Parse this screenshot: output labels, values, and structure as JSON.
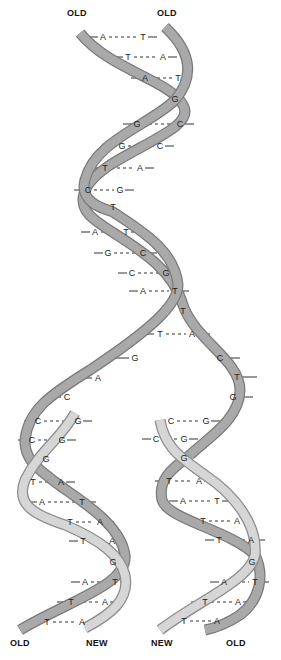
{
  "labels": {
    "top_left": "OLD",
    "top_right": "OLD",
    "bottom_1": "OLD",
    "bottom_2": "NEW",
    "bottom_3": "NEW",
    "bottom_4": "OLD"
  },
  "colors": {
    "old_strand": "#a9a9a9",
    "old_strand_edge": "#7a7a7a",
    "new_strand": "#d6d6d6",
    "new_strand_edge": "#8c8c8c",
    "text": "#222222"
  },
  "parent_helix": {
    "base_pairs": [
      {
        "left": "A",
        "right": "T",
        "x1": 103,
        "x2": 143,
        "y": 37
      },
      {
        "left": "T",
        "right": "A",
        "x1": 128,
        "x2": 163,
        "y": 57
      },
      {
        "left": "A",
        "right": "T",
        "x1": 145,
        "x2": 178,
        "y": 78
      },
      {
        "left": "G",
        "right": "",
        "x1": 175,
        "x2": 175,
        "y": 99
      },
      {
        "left": "G",
        "right": "C",
        "x1": 137,
        "x2": 180,
        "y": 124
      },
      {
        "left": "G",
        "right": "C",
        "x1": 122,
        "x2": 160,
        "y": 146
      },
      {
        "left": "T",
        "right": "A",
        "x1": 105,
        "x2": 140,
        "y": 168
      },
      {
        "left": "C",
        "right": "G",
        "x1": 88,
        "x2": 120,
        "y": 190
      },
      {
        "left": "T",
        "right": "",
        "x1": 113,
        "x2": 113,
        "y": 207
      },
      {
        "left": "A",
        "right": "T",
        "x1": 95,
        "x2": 126,
        "y": 232
      },
      {
        "left": "G",
        "right": "C",
        "x1": 108,
        "x2": 143,
        "y": 253
      },
      {
        "left": "C",
        "right": "G",
        "x1": 132,
        "x2": 166,
        "y": 273
      },
      {
        "left": "A",
        "right": "T",
        "x1": 143,
        "x2": 175,
        "y": 291
      },
      {
        "left": "T",
        "right": "",
        "x1": 183,
        "x2": 183,
        "y": 311
      }
    ]
  },
  "fork": {
    "left_bases": [
      {
        "base": "T",
        "x": 160,
        "y": 334,
        "pair": "A",
        "px": 192
      },
      {
        "base": "G",
        "x": 135,
        "y": 358
      },
      {
        "base": "A",
        "x": 98,
        "y": 378
      },
      {
        "base": "C",
        "x": 67,
        "y": 397
      }
    ],
    "right_bases": [
      {
        "base": "C",
        "x": 220,
        "y": 358
      },
      {
        "base": "T",
        "x": 237,
        "y": 377
      },
      {
        "base": "G",
        "x": 233,
        "y": 397
      }
    ]
  },
  "daughter_left": {
    "base_pairs": [
      {
        "left": "C",
        "right": "G",
        "x1": 38,
        "x2": 78,
        "y": 421
      },
      {
        "left": "C",
        "right": "G",
        "x1": 32,
        "x2": 62,
        "y": 440
      },
      {
        "left": "G",
        "right": "",
        "x1": 46,
        "x2": 46,
        "y": 459
      },
      {
        "left": "T",
        "right": "A",
        "x1": 33,
        "x2": 61,
        "y": 482
      },
      {
        "left": "A",
        "right": "T",
        "x1": 42,
        "x2": 82,
        "y": 502
      },
      {
        "left": "T",
        "right": "A",
        "x1": 70,
        "x2": 100,
        "y": 522
      },
      {
        "left": "T",
        "right": "A",
        "x1": 83,
        "x2": 112,
        "y": 541
      },
      {
        "left": "G",
        "right": "",
        "x1": 113,
        "x2": 113,
        "y": 562
      },
      {
        "left": "A",
        "right": "T",
        "x1": 85,
        "x2": 115,
        "y": 582
      },
      {
        "left": "T",
        "right": "A",
        "x1": 71,
        "x2": 105,
        "y": 602
      },
      {
        "left": "T",
        "right": "A",
        "x1": 47,
        "x2": 82,
        "y": 622
      }
    ]
  },
  "daughter_right": {
    "base_pairs": [
      {
        "left": "C",
        "right": "G",
        "x1": 171,
        "x2": 206,
        "y": 421
      },
      {
        "left": "C",
        "right": "G",
        "x1": 156,
        "x2": 184,
        "y": 439
      },
      {
        "left": "G",
        "right": "",
        "x1": 184,
        "x2": 184,
        "y": 458
      },
      {
        "left": "T",
        "right": "A",
        "x1": 169,
        "x2": 199,
        "y": 481
      },
      {
        "left": "A",
        "right": "T",
        "x1": 183,
        "x2": 217,
        "y": 501
      },
      {
        "left": "T",
        "right": "A",
        "x1": 203,
        "x2": 237,
        "y": 521
      },
      {
        "left": "T",
        "right": "A",
        "x1": 219,
        "x2": 251,
        "y": 540
      },
      {
        "left": "G",
        "right": "",
        "x1": 252,
        "x2": 252,
        "y": 562
      },
      {
        "left": "A",
        "right": "T",
        "x1": 224,
        "x2": 255,
        "y": 582
      },
      {
        "left": "T",
        "right": "A",
        "x1": 205,
        "x2": 238,
        "y": 602
      },
      {
        "left": "T",
        "right": "A",
        "x1": 184,
        "x2": 217,
        "y": 621
      }
    ]
  }
}
